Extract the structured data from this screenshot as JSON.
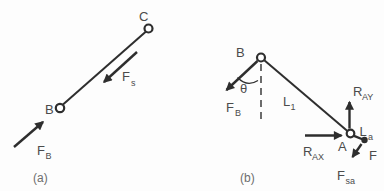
{
  "canvas": {
    "width": 384,
    "height": 191,
    "background": "#fdfdfd",
    "stroke_color": "#2e2e2e",
    "text_color": "#4b4b4b",
    "caption_color": "#6e6e6e"
  },
  "diagram_a": {
    "caption": "(a)",
    "point_b": "B",
    "point_c": "C",
    "force_spring": {
      "main": "F",
      "sub": "s"
    },
    "force_b": {
      "main": "F",
      "sub": "B"
    }
  },
  "diagram_b": {
    "caption": "(b)",
    "point_b": "B",
    "point_a": "A",
    "angle": "θ",
    "link_1": {
      "main": "L",
      "sub": "1"
    },
    "link_a": {
      "main": "L",
      "sub": "a"
    },
    "force_b": {
      "main": "F",
      "sub": "B"
    },
    "reaction_ay": {
      "main": "R",
      "sub": "AY"
    },
    "reaction_ax": {
      "main": "R",
      "sub": "AX"
    },
    "force_f": "F",
    "force_sa": {
      "main": "F",
      "sub": "sa"
    }
  }
}
